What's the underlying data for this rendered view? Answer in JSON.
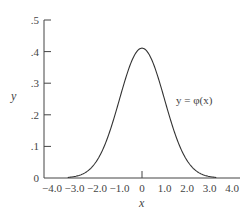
{
  "chart_data": {
    "type": "line",
    "title": "",
    "xlabel": "x",
    "ylabel": "y",
    "xlim": [
      -4.0,
      4.0
    ],
    "ylim": [
      0,
      0.5
    ],
    "grid": false,
    "legend": "none",
    "x_ticks": [
      "-4.0",
      "-3.0",
      "-2.0",
      "-1.0",
      "0",
      "1.0",
      "2.0",
      "3.0",
      "4.0"
    ],
    "y_ticks": [
      "0",
      ".1",
      ".2",
      ".3",
      ".4",
      ".5"
    ],
    "annotations": [
      {
        "text": "y = φ(x)",
        "x": 2.0,
        "y": 0.22
      }
    ],
    "series": [
      {
        "name": "y = φ(x)",
        "description": "standard normal probability density function",
        "x": [
          -3.5,
          -3.0,
          -2.5,
          -2.0,
          -1.5,
          -1.0,
          -0.5,
          0,
          0.5,
          1.0,
          1.5,
          2.0,
          2.5,
          3.0,
          3.5
        ],
        "values": [
          0.001,
          0.004,
          0.018,
          0.054,
          0.13,
          0.242,
          0.352,
          0.399,
          0.352,
          0.242,
          0.13,
          0.054,
          0.018,
          0.004,
          0.001
        ]
      }
    ]
  },
  "labels": {
    "x_axis": "x",
    "y_axis": "y",
    "curve": "y = φ(x)"
  }
}
